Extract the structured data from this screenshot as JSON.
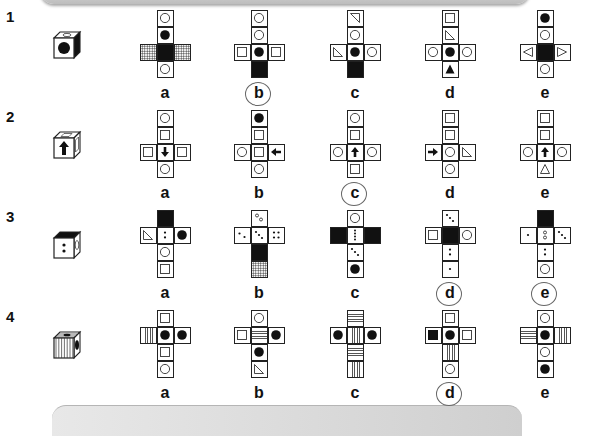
{
  "decorations": {
    "banner_top": true,
    "banner_bottom": true
  },
  "questions": [
    {
      "number": "1",
      "cube": {
        "front": "black-dot",
        "top": "circle",
        "side": "black"
      },
      "options": [
        {
          "label": "a",
          "cells": [
            [
              1,
              0,
              "circle"
            ],
            [
              1,
              1,
              "dot"
            ],
            [
              0,
              2,
              "hatch"
            ],
            [
              1,
              2,
              "black"
            ],
            [
              2,
              2,
              "hatch"
            ],
            [
              1,
              3,
              "circle"
            ]
          ]
        },
        {
          "label": "b",
          "marked": true,
          "cells": [
            [
              1,
              0,
              "circle"
            ],
            [
              1,
              1,
              "circle"
            ],
            [
              0,
              2,
              "square"
            ],
            [
              1,
              2,
              "dot"
            ],
            [
              2,
              2,
              "square"
            ],
            [
              1,
              3,
              "black"
            ]
          ]
        },
        {
          "label": "c",
          "cells": [
            [
              1,
              0,
              "tri-tr"
            ],
            [
              1,
              1,
              "circle"
            ],
            [
              0,
              2,
              "tri-bl"
            ],
            [
              1,
              2,
              "dot"
            ],
            [
              2,
              2,
              "circle"
            ],
            [
              1,
              3,
              "black"
            ]
          ]
        },
        {
          "label": "d",
          "cells": [
            [
              1,
              0,
              "square"
            ],
            [
              1,
              1,
              "tri-bl"
            ],
            [
              0,
              2,
              "circle"
            ],
            [
              1,
              2,
              "dot"
            ],
            [
              2,
              2,
              "circle"
            ],
            [
              1,
              3,
              "tri-up-black"
            ]
          ]
        },
        {
          "label": "e",
          "cells": [
            [
              1,
              0,
              "dot"
            ],
            [
              1,
              1,
              "circle"
            ],
            [
              0,
              2,
              "tri-left"
            ],
            [
              1,
              2,
              "black"
            ],
            [
              2,
              2,
              "tri-right"
            ],
            [
              1,
              3,
              "circle"
            ]
          ]
        }
      ]
    },
    {
      "number": "2",
      "cube": {
        "front": "arrow-up",
        "top": "square",
        "side": "square"
      },
      "options": [
        {
          "label": "a",
          "cells": [
            [
              1,
              0,
              "circle"
            ],
            [
              1,
              1,
              "square"
            ],
            [
              0,
              2,
              "square"
            ],
            [
              1,
              2,
              "arrow-down"
            ],
            [
              2,
              2,
              "square"
            ],
            [
              1,
              3,
              "circle"
            ]
          ]
        },
        {
          "label": "b",
          "cells": [
            [
              1,
              0,
              "dot"
            ],
            [
              1,
              1,
              "square"
            ],
            [
              0,
              2,
              "circle"
            ],
            [
              1,
              2,
              "square"
            ],
            [
              2,
              2,
              "arrow-left"
            ],
            [
              1,
              3,
              "circle"
            ]
          ]
        },
        {
          "label": "c",
          "marked": true,
          "cells": [
            [
              1,
              0,
              "circle"
            ],
            [
              1,
              1,
              "square"
            ],
            [
              0,
              2,
              "circle"
            ],
            [
              1,
              2,
              "arrow-up"
            ],
            [
              2,
              2,
              "circle"
            ],
            [
              1,
              3,
              "square"
            ]
          ]
        },
        {
          "label": "d",
          "cells": [
            [
              1,
              0,
              "square"
            ],
            [
              1,
              1,
              "square"
            ],
            [
              0,
              2,
              "arrow-right"
            ],
            [
              1,
              2,
              "circle"
            ],
            [
              2,
              2,
              "tri-bl"
            ],
            [
              1,
              3,
              "circle"
            ]
          ]
        },
        {
          "label": "e",
          "cells": [
            [
              1,
              0,
              "square"
            ],
            [
              1,
              1,
              "square"
            ],
            [
              0,
              2,
              "circle"
            ],
            [
              1,
              2,
              "arrow-up"
            ],
            [
              2,
              2,
              "circle"
            ],
            [
              1,
              3,
              "tri-up"
            ]
          ]
        }
      ]
    },
    {
      "number": "3",
      "cube": {
        "front": "two-dots-vertical",
        "top": "black",
        "side": "circle"
      },
      "options": [
        {
          "label": "a",
          "cells": [
            [
              1,
              0,
              "black"
            ],
            [
              0,
              1,
              "tri-bl"
            ],
            [
              1,
              1,
              "two-dots-vertical"
            ],
            [
              2,
              1,
              "dot"
            ],
            [
              1,
              2,
              "circle"
            ],
            [
              1,
              3,
              "square"
            ]
          ]
        },
        {
          "label": "b",
          "cells": [
            [
              1,
              0,
              "two-open-dots"
            ],
            [
              0,
              1,
              "two-dots-diag"
            ],
            [
              1,
              1,
              "three-dots-diag"
            ],
            [
              2,
              1,
              "four-dots"
            ],
            [
              1,
              2,
              "black"
            ],
            [
              1,
              3,
              "hatch"
            ]
          ]
        },
        {
          "label": "c",
          "cells": [
            [
              1,
              0,
              "circle"
            ],
            [
              0,
              1,
              "black"
            ],
            [
              1,
              1,
              "four-dots-vertical"
            ],
            [
              2,
              1,
              "black"
            ],
            [
              1,
              2,
              "three-dots-diag"
            ],
            [
              1,
              3,
              "dot"
            ]
          ]
        },
        {
          "label": "d",
          "marked": true,
          "cells": [
            [
              1,
              0,
              "three-dots-diag"
            ],
            [
              0,
              1,
              "square"
            ],
            [
              1,
              1,
              "black"
            ],
            [
              2,
              1,
              "circle"
            ],
            [
              1,
              2,
              "two-dots-vertical"
            ],
            [
              1,
              3,
              "one-dot"
            ]
          ]
        },
        {
          "label": "e",
          "marked": true,
          "cells": [
            [
              1,
              0,
              "black"
            ],
            [
              0,
              1,
              "one-dot"
            ],
            [
              1,
              1,
              "two-open-dots-vertical"
            ],
            [
              2,
              1,
              "three-dots-diag"
            ],
            [
              1,
              2,
              "two-dots-vertical"
            ],
            [
              1,
              3,
              "circle"
            ]
          ]
        }
      ]
    },
    {
      "number": "4",
      "cube": {
        "front": "vertical-stripes",
        "top": "horizontal-stripes",
        "side": "black-dot"
      },
      "options": [
        {
          "label": "a",
          "cells": [
            [
              1,
              0,
              "square"
            ],
            [
              0,
              1,
              "vstripes"
            ],
            [
              1,
              1,
              "dot"
            ],
            [
              2,
              1,
              "dot"
            ],
            [
              1,
              2,
              "square"
            ],
            [
              1,
              3,
              "circle"
            ]
          ]
        },
        {
          "label": "b",
          "cells": [
            [
              1,
              0,
              "circle"
            ],
            [
              0,
              1,
              "square"
            ],
            [
              1,
              1,
              "hstripes"
            ],
            [
              2,
              1,
              "dot"
            ],
            [
              1,
              2,
              "dot"
            ],
            [
              1,
              3,
              "tri-bl"
            ]
          ]
        },
        {
          "label": "c",
          "cells": [
            [
              1,
              0,
              "hstripes"
            ],
            [
              0,
              1,
              "dot"
            ],
            [
              1,
              1,
              "vstripes"
            ],
            [
              2,
              1,
              "dot"
            ],
            [
              1,
              2,
              "hstripes"
            ],
            [
              1,
              3,
              "vstripes"
            ]
          ]
        },
        {
          "label": "d",
          "marked": true,
          "cells": [
            [
              1,
              0,
              "square"
            ],
            [
              0,
              1,
              "black-square"
            ],
            [
              1,
              1,
              "dot"
            ],
            [
              2,
              1,
              "square"
            ],
            [
              1,
              2,
              "vstripes"
            ],
            [
              1,
              3,
              "circle"
            ]
          ]
        },
        {
          "label": "e",
          "cells": [
            [
              1,
              0,
              "circle"
            ],
            [
              0,
              1,
              "hstripes"
            ],
            [
              1,
              1,
              "dot"
            ],
            [
              2,
              1,
              "vstripes"
            ],
            [
              1,
              2,
              "circle"
            ],
            [
              1,
              3,
              "dot"
            ]
          ]
        }
      ]
    }
  ]
}
